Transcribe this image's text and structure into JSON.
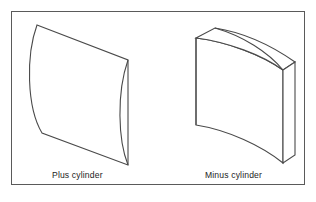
{
  "figure": {
    "background_color": "#ffffff",
    "frame": {
      "name": "figure-border",
      "color": "#5a5a5a",
      "x": 11,
      "y": 11,
      "width": 294,
      "height": 174
    },
    "stroke_color": "#4a4a4a",
    "fill_color": "#ffffff",
    "text_color": "#1c1c1c"
  },
  "captions": {
    "plus": "Plus cylinder",
    "minus": "Minus cylinder"
  },
  "shapes": [
    {
      "id": "plus-cylinder",
      "label": "Plus cylinder",
      "description": "Convex lens-shaped slab drawn in oblique projection with a curved left edge and a pointed right apex",
      "front_face_path": "M 37 25 L 128 60 L 128 165 L 42 133 C 25 106 25 56 37 25 Z",
      "curved_edge_path": "M 128 60 C 116 94 118 140 128 165",
      "inner_seam_path": "M 128 60 C 116 94 118 140 128 165"
    },
    {
      "id": "minus-cylinder",
      "label": "Minus cylinder",
      "description": "Concave slab block drawn in oblique projection with a curved top edge, curved bottom edge and a visible right end face",
      "left_edge_path": "M 196 38 L 196 125",
      "top_front_curve_path": "M 196 38 C 228 42 262 55 283 70",
      "top_back_path": "M 196 38 L 215 28 C 247 33 275 48 295 62",
      "top_ridge_path": "M 215 28 C 243 36 268 52 283 70",
      "bottom_curve_path": "M 196 125 C 228 130 262 146 283 163",
      "front_right_edge_path": "M 283 70 L 283 163",
      "right_back_edge_path": "M 295 62 L 295 155",
      "right_face_bottom_path": "M 283 163 L 295 155",
      "right_face_top_path": "M 283 70 L 295 62"
    }
  ]
}
